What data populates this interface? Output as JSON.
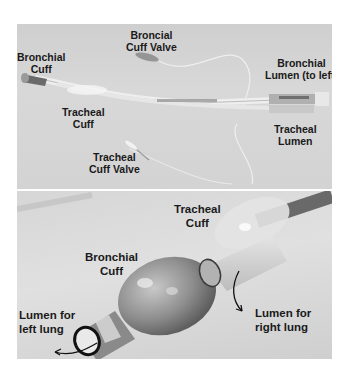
{
  "figure": {
    "top_panel": {
      "description": "Left-sided double-lumen endobronchial tube, full view",
      "labels": {
        "bronchial_cuff": [
          "Bronchial",
          "Cuff"
        ],
        "bronchial_cuff_valve": [
          "Broncial",
          "Cuff Valve"
        ],
        "bronchial_lumen": [
          "Bronchial",
          "Lumen (to left)"
        ],
        "tracheal_cuff": [
          "Tracheal",
          "Cuff"
        ],
        "tracheal_lumen": [
          "Tracheal",
          "Lumen"
        ],
        "tracheal_cuff_valve": [
          "Tracheal",
          "Cuff Valve"
        ]
      }
    },
    "bottom_panel": {
      "description": "Close-up of distal tip with inflated cuffs",
      "labels": {
        "tracheal_cuff": [
          "Tracheal",
          "Cuff"
        ],
        "bronchial_cuff": [
          "Bronchial",
          "Cuff"
        ],
        "lumen_left": [
          "Lumen for",
          "left lung"
        ],
        "lumen_right": [
          "Lumen for",
          "right lung"
        ]
      }
    },
    "colors": {
      "background": "#ffffff",
      "photo_gray": "#d4d4d4",
      "label_text": "#1a1a1a"
    }
  }
}
